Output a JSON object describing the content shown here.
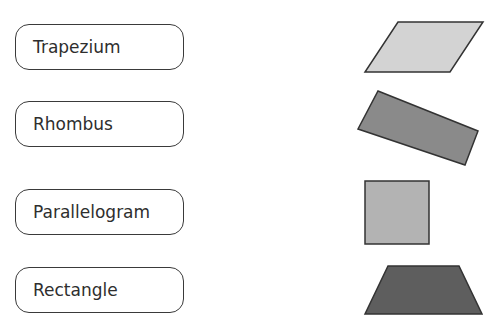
{
  "labels": [
    {
      "text": "Trapezium",
      "top": 24
    },
    {
      "text": "Rhombus",
      "top": 101
    },
    {
      "text": "Parallelogram",
      "top": 189
    },
    {
      "text": "Rectangle",
      "top": 267
    }
  ],
  "shapes": [
    {
      "name": "parallelogram",
      "points": "398,22 483,22 450,72 365,72",
      "fill": "#d3d3d3"
    },
    {
      "name": "rotated-rectangle",
      "points": "378,91 478,131 465,165 358,129",
      "fill": "#8a8a8a"
    },
    {
      "name": "square",
      "points": "365,181 429,181 429,244 365,244",
      "fill": "#b3b3b3"
    },
    {
      "name": "trapezoid",
      "points": "388,266 459,266 482,314 365,314",
      "fill": "#5e5e5e"
    }
  ],
  "stroke_color": "#333333"
}
